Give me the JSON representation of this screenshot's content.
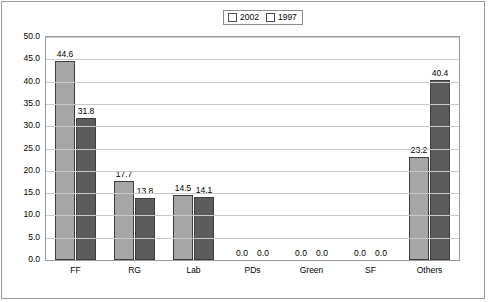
{
  "chart_data": {
    "type": "bar",
    "title": "",
    "xlabel": "",
    "ylabel": "",
    "ylim": [
      0.0,
      50.0
    ],
    "ytick_labels": [
      "50.0",
      "45.0",
      "40.0",
      "35.0",
      "30.0",
      "25.0",
      "20.0",
      "15.0",
      "10.0",
      "5.0",
      "0.0"
    ],
    "yticks": [
      50.0,
      45.0,
      40.0,
      35.0,
      30.0,
      25.0,
      20.0,
      15.0,
      10.0,
      5.0,
      0.0
    ],
    "grid": true,
    "legend_position": "top-center",
    "categories": [
      "FF",
      "RG",
      "Lab",
      "PDs",
      "Green",
      "SF",
      "Others"
    ],
    "series": [
      {
        "name": "2002",
        "color": "#a6a6a6",
        "values": [
          44.6,
          17.7,
          14.5,
          0.0,
          0.0,
          0.0,
          23.2
        ],
        "labels": [
          "44.6",
          "17.7",
          "14.5",
          "0.0",
          "0.0",
          "0.0",
          "23.2"
        ]
      },
      {
        "name": "1997",
        "color": "#5c5c5c",
        "values": [
          31.8,
          13.8,
          14.1,
          0.0,
          0.0,
          0.0,
          40.4
        ],
        "labels": [
          "31.8",
          "13.8",
          "14.1",
          "0.0",
          "0.0",
          "0.0",
          "40.4"
        ]
      }
    ]
  },
  "legend": {
    "items": [
      {
        "label": "2002",
        "color": "#a6a6a6"
      },
      {
        "label": "1997",
        "color": "#5c5c5c"
      }
    ]
  }
}
